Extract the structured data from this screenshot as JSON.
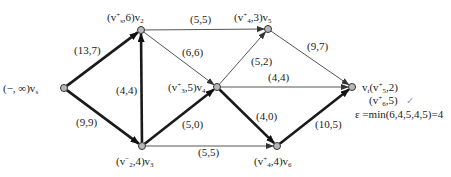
{
  "diagram": {
    "type": "flow-network",
    "colors": {
      "thick_edge": "#1a1a1a",
      "thin_edge": "#555555",
      "node_fill": "#b8b8b8",
      "node_stroke": "#333333",
      "check": "#9a9a9a"
    },
    "nodes": [
      {
        "id": "vs",
        "x": 64,
        "y": 88,
        "label_pre": "(−, ∞)",
        "name": "v",
        "sub": "s",
        "label_x": 3,
        "label_y": 82
      },
      {
        "id": "v2",
        "x": 141,
        "y": 30,
        "label_pre": "(v",
        "label_sup": "+",
        "label_sub": "s",
        "label_post": ",6)",
        "name": "v",
        "sub": "2",
        "label_x": 107,
        "label_y": 11
      },
      {
        "id": "v3",
        "x": 142,
        "y": 146,
        "label_pre": "(v",
        "label_sup": "−",
        "label_sub": "2",
        "label_post": ",4)",
        "name": "v",
        "sub": "3",
        "label_x": 116,
        "label_y": 155
      },
      {
        "id": "v4",
        "x": 217,
        "y": 87,
        "label_pre": "(v",
        "label_sup": "+",
        "label_sub": "3",
        "label_post": ",5)",
        "name": "v",
        "sub": "4",
        "label_x": 168,
        "label_y": 81
      },
      {
        "id": "v5",
        "x": 268,
        "y": 29,
        "label_pre": "(v",
        "label_sup": "+",
        "label_sub": "4",
        "label_post": ",3)",
        "name": "v",
        "sub": "5",
        "label_x": 234,
        "label_y": 11
      },
      {
        "id": "v6",
        "x": 277,
        "y": 146,
        "label_pre": "(v",
        "label_sup": "+",
        "label_sub": "4",
        "label_post": ",4)",
        "name": "v",
        "sub": "6",
        "label_x": 254,
        "label_y": 155
      },
      {
        "id": "vt",
        "x": 352,
        "y": 87,
        "label_pre": "v",
        "label_pre_sub": "t",
        "label_mid": "(v",
        "label_sup": "+",
        "label_sub": "5",
        "label_post": ",2)",
        "name": "",
        "sub": "",
        "label_x": 362,
        "label_y": 81
      }
    ],
    "edges": [
      {
        "from": "vs",
        "to": "v2",
        "label": "(13,7)",
        "thick": true,
        "lx": 74,
        "ly": 44
      },
      {
        "from": "vs",
        "to": "v3",
        "label": "(9,9)",
        "thick": true,
        "lx": 76,
        "ly": 116
      },
      {
        "from": "v3",
        "to": "v2",
        "label": "(4,4)",
        "thick": true,
        "lx": 116,
        "ly": 84
      },
      {
        "from": "v2",
        "to": "v5",
        "label": "(5,5)",
        "thick": false,
        "lx": 190,
        "ly": 13
      },
      {
        "from": "v2",
        "to": "v4",
        "label": "(6,6)",
        "thick": false,
        "lx": 182,
        "ly": 46
      },
      {
        "from": "v3",
        "to": "v4",
        "label": "(5,0)",
        "thick": true,
        "lx": 182,
        "ly": 118
      },
      {
        "from": "v3",
        "to": "v6",
        "label": "(5,5)",
        "thick": false,
        "lx": 198,
        "ly": 146
      },
      {
        "from": "v4",
        "to": "v5",
        "label": "(5,2)",
        "thick": false,
        "lx": 251,
        "ly": 55
      },
      {
        "from": "v4",
        "to": "vt",
        "label": "(4,4)",
        "thick": false,
        "lx": 268,
        "ly": 71
      },
      {
        "from": "v4",
        "to": "v6",
        "label": "(4,0)",
        "thick": true,
        "lx": 256,
        "ly": 110
      },
      {
        "from": "v5",
        "to": "vt",
        "label": "(9,7)",
        "thick": false,
        "lx": 307,
        "ly": 40
      },
      {
        "from": "v6",
        "to": "vt",
        "label": "(10,5)",
        "thick": true,
        "lx": 315,
        "ly": 118
      }
    ],
    "annotations": {
      "vt_second_label_pre": "(v",
      "vt_second_label_sup": "+",
      "vt_second_label_sub": "6",
      "vt_second_label_post": ",5)",
      "checkmark": "✓",
      "epsilon_line": "ε =min(6,4,5,4,5)=4"
    }
  }
}
